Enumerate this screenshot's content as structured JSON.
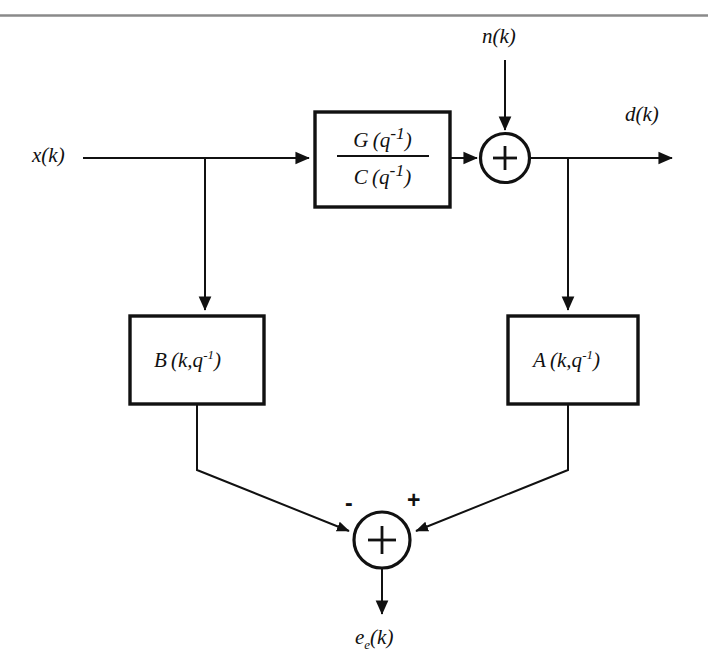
{
  "figure": {
    "type": "block-diagram",
    "top_rule_color": "#8a8a8a",
    "line_color": "#111111",
    "background": "#ffffff",
    "signals": {
      "input": "x(k)",
      "noise": "n(k)",
      "plant_output": "d(k)",
      "error": "e",
      "error_sub": "e",
      "error_arg": "(k)"
    },
    "blocks": [
      {
        "id": "plant",
        "numerator_name": "G",
        "numerator_arg": "(q",
        "numerator_sup": "-1",
        "numerator_close": ")",
        "denominator_name": "C",
        "denominator_arg": "(q",
        "denominator_sup": "-1",
        "denominator_close": ")"
      },
      {
        "id": "filter-b",
        "name": "B",
        "arg": "(k,q",
        "sup": "-1",
        "close": ")"
      },
      {
        "id": "filter-a",
        "name": "A",
        "arg": "(k,q",
        "sup": "-1",
        "close": ")"
      }
    ],
    "summers": [
      {
        "id": "noise-summer",
        "operator": "+",
        "inputs": [
          "plant",
          "noise"
        ]
      },
      {
        "id": "error-summer",
        "operator": "+",
        "left_sign": "-",
        "right_sign": "+",
        "inputs": [
          "filter-b",
          "filter-a"
        ]
      }
    ]
  }
}
